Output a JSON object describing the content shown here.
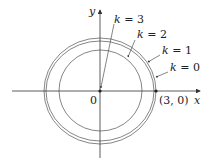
{
  "diagram": {
    "type": "level-curves",
    "axes": {
      "x_label": "x",
      "y_label": "y",
      "origin_label": "0"
    },
    "point_label": "(3, 0)",
    "curves": [
      {
        "k_var": "k",
        "eq": "=",
        "value": "3",
        "label": "k = 3",
        "note": "point at origin"
      },
      {
        "k_var": "k",
        "eq": "=",
        "value": "2",
        "label": "k = 2"
      },
      {
        "k_var": "k",
        "eq": "=",
        "value": "1",
        "label": "k = 1"
      },
      {
        "k_var": "k",
        "eq": "=",
        "value": "0",
        "label": "k = 0"
      }
    ],
    "colors": {
      "axis": "#333333",
      "curve": "#666666",
      "text": "#222222",
      "background": "#ffffff"
    }
  }
}
